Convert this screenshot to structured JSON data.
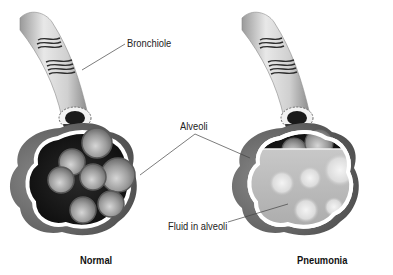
{
  "labels": {
    "bronchiole": "Bronchiole",
    "alveoli": "Alveoli",
    "fluid": "Fluid in alveoli",
    "normal": "Normal",
    "pneumonia": "Pneumonia"
  },
  "panels": [
    {
      "id": "normal",
      "caption": "Normal",
      "state": "air-filled alveoli"
    },
    {
      "id": "pneumonia",
      "caption": "Pneumonia",
      "state": "fluid-filled alveoli"
    }
  ],
  "colors": {
    "background": "#ffffff",
    "outer_tissue": "#6e6e6e",
    "sac_dark": "#151515",
    "sac_outline": "#ffffff",
    "alveolus": "#9a9a9a",
    "fluid": "#b9b9b9",
    "label_text": "#222222",
    "leader_line": "#444444"
  }
}
